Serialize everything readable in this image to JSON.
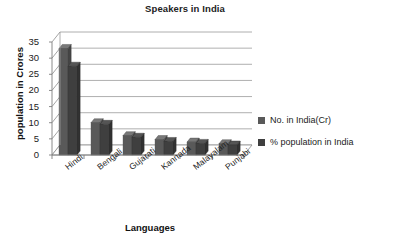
{
  "chart_data": {
    "type": "bar",
    "title": "Speakers in India",
    "xlabel": "Languages",
    "ylabel": "population in Crores",
    "categories": [
      "Hindi",
      "Bengali",
      "Gujarati",
      "Kannada",
      "Malayalam",
      "Punjabi"
    ],
    "series": [
      {
        "name": "No. in India(Cr)",
        "color": "#595959",
        "values": [
          33,
          10,
          6,
          4.8,
          4,
          3.5
        ]
      },
      {
        "name": "% population in India",
        "color": "#3f3f3f",
        "values": [
          27.5,
          9.5,
          5.5,
          4.2,
          3.6,
          3.1
        ]
      }
    ],
    "ylim": [
      0,
      35
    ],
    "yticks": [
      0,
      5,
      10,
      15,
      20,
      25,
      30,
      35
    ],
    "ytick_labels": [
      "0",
      "5",
      "10",
      "15",
      "20",
      "25",
      "30",
      "35"
    ],
    "grid": true,
    "grid_color": "#9a9a9a",
    "legend_position": "right",
    "style": "3d-perspective",
    "background": "#ffffff"
  }
}
